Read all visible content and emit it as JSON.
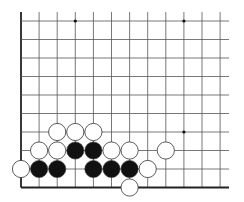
{
  "board": {
    "type": "go-board-corner-diagram",
    "origin_x": 21,
    "origin_y": 21,
    "spacing_x": 18.1,
    "spacing_y": 18.5,
    "columns": 12,
    "rows": 10,
    "right_extent": 229,
    "left_edge_top": 12,
    "colors": {
      "background": "#ffffff",
      "line": "#555555",
      "edge": "#222222",
      "black_stone": "#111111",
      "white_stone": "#ffffff",
      "stone_outline": "#333333",
      "star_point": "#111111"
    },
    "star_points": [
      {
        "col": 3,
        "row": 0
      },
      {
        "col": 9,
        "row": 0
      },
      {
        "col": 9,
        "row": 6
      }
    ],
    "stones": [
      {
        "color": "white",
        "col": 2,
        "row": 6
      },
      {
        "color": "white",
        "col": 3,
        "row": 6
      },
      {
        "color": "white",
        "col": 4,
        "row": 6
      },
      {
        "color": "white",
        "col": 1,
        "row": 7
      },
      {
        "color": "white",
        "col": 2,
        "row": 7
      },
      {
        "color": "black",
        "col": 3,
        "row": 7
      },
      {
        "color": "black",
        "col": 4,
        "row": 7
      },
      {
        "color": "white",
        "col": 5,
        "row": 7
      },
      {
        "color": "white",
        "col": 6,
        "row": 7
      },
      {
        "color": "white",
        "col": 8,
        "row": 7
      },
      {
        "color": "white",
        "col": 0,
        "row": 8
      },
      {
        "color": "black",
        "col": 1,
        "row": 8
      },
      {
        "color": "black",
        "col": 2,
        "row": 8
      },
      {
        "color": "black",
        "col": 4,
        "row": 8
      },
      {
        "color": "black",
        "col": 5,
        "row": 8
      },
      {
        "color": "black",
        "col": 6,
        "row": 8
      },
      {
        "color": "white",
        "col": 7,
        "row": 8
      },
      {
        "color": "white",
        "col": 6,
        "row": 9
      }
    ]
  }
}
